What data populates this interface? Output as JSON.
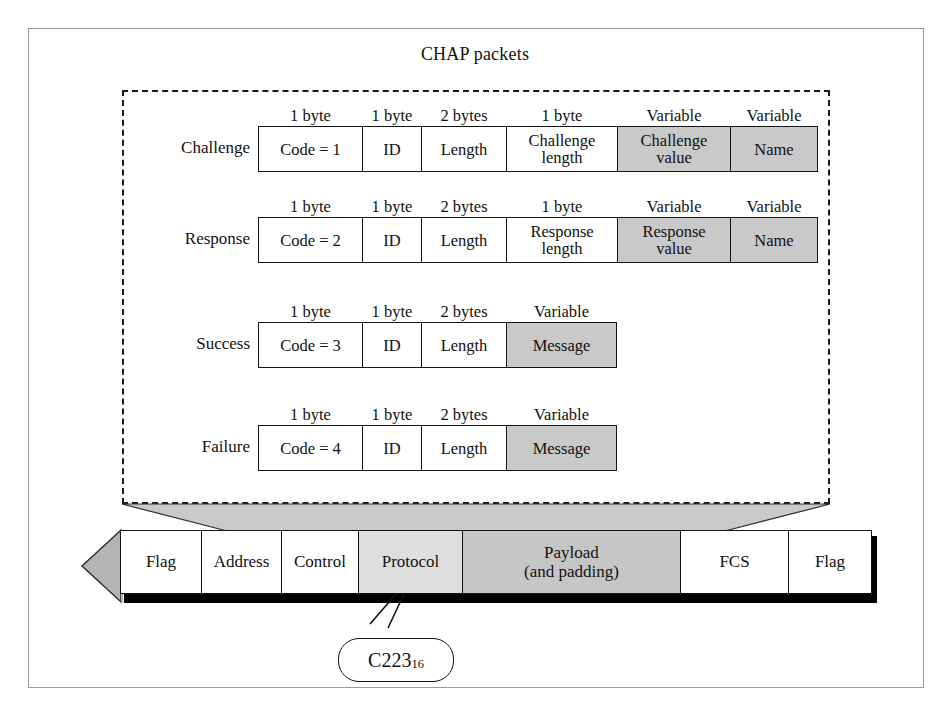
{
  "title": "CHAP packets",
  "colors": {
    "shaded_cell": "#c9c9c9",
    "protocol_cell": "#dedede",
    "payload_cell": "#c6c6c6",
    "border": "#141414",
    "outer_frame": "#9a9a9a",
    "arrow_fill": "#b4b4b4",
    "connector_fill": "#c9c9c9"
  },
  "packets": [
    {
      "label": "Challenge",
      "fields": [
        {
          "size": "1 byte",
          "text": "Code = 1",
          "shaded": false,
          "width": 104
        },
        {
          "size": "1 byte",
          "text": "ID",
          "shaded": false,
          "width": 59
        },
        {
          "size": "2 bytes",
          "text": "Length",
          "shaded": false,
          "width": 85
        },
        {
          "size": "1 byte",
          "text": "Challenge length",
          "shaded": false,
          "width": 111
        },
        {
          "size": "Variable",
          "text": "Challenge value",
          "shaded": true,
          "width": 113
        },
        {
          "size": "Variable",
          "text": "Name",
          "shaded": true,
          "width": 88
        }
      ]
    },
    {
      "label": "Response",
      "fields": [
        {
          "size": "1 byte",
          "text": "Code = 2",
          "shaded": false,
          "width": 104
        },
        {
          "size": "1 byte",
          "text": "ID",
          "shaded": false,
          "width": 59
        },
        {
          "size": "2 bytes",
          "text": "Length",
          "shaded": false,
          "width": 85
        },
        {
          "size": "1 byte",
          "text": "Response length",
          "shaded": false,
          "width": 111
        },
        {
          "size": "Variable",
          "text": "Response value",
          "shaded": true,
          "width": 113
        },
        {
          "size": "Variable",
          "text": "Name",
          "shaded": true,
          "width": 88
        }
      ]
    },
    {
      "label": "Success",
      "fields": [
        {
          "size": "1 byte",
          "text": "Code = 3",
          "shaded": false,
          "width": 104
        },
        {
          "size": "1 byte",
          "text": "ID",
          "shaded": false,
          "width": 59
        },
        {
          "size": "2 bytes",
          "text": "Length",
          "shaded": false,
          "width": 85
        },
        {
          "size": "Variable",
          "text": "Message",
          "shaded": true,
          "width": 111
        }
      ]
    },
    {
      "label": "Failure",
      "fields": [
        {
          "size": "1 byte",
          "text": "Code = 4",
          "shaded": false,
          "width": 104
        },
        {
          "size": "1 byte",
          "text": "ID",
          "shaded": false,
          "width": 59
        },
        {
          "size": "2 bytes",
          "text": "Length",
          "shaded": false,
          "width": 85
        },
        {
          "size": "Variable",
          "text": "Message",
          "shaded": true,
          "width": 111
        }
      ]
    }
  ],
  "ppp_frame": {
    "cells": [
      {
        "text": "Flag",
        "fill": "white",
        "width": 81
      },
      {
        "text": "Address",
        "fill": "white",
        "width": 80
      },
      {
        "text": "Control",
        "fill": "white",
        "width": 77
      },
      {
        "text": "Protocol",
        "fill": "light",
        "width": 104
      },
      {
        "text": "Payload\n(and padding)",
        "fill": "medium",
        "width": 218
      },
      {
        "text": "FCS",
        "fill": "white",
        "width": 108
      },
      {
        "text": "Flag",
        "fill": "white",
        "width": 84
      }
    ]
  },
  "callout": {
    "value": "C223",
    "subscript": "16"
  }
}
